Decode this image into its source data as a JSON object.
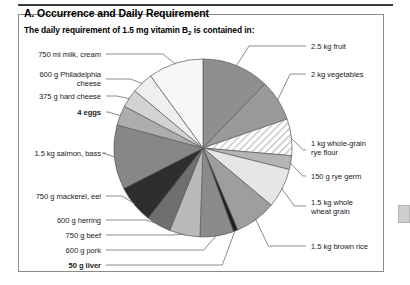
{
  "figure": {
    "section_title": "A. Occurrence and Daily Requirement",
    "subtitle_prefix": "The daily requirement of 1.5 mg vitamin B",
    "subtitle_subscript": "2",
    "subtitle_suffix": " is contained in:"
  },
  "colors": {
    "rule": "#3a3a3a",
    "panel_border": "#8b8b8b",
    "slice_stroke": "#5a5a5a",
    "page_tab": "#cfcfcf",
    "text": "#1a1a1a"
  },
  "chart_data": {
    "type": "pie",
    "title": "The daily requirement of 1.5 mg vitamin B2 is contained in:",
    "unit": "degrees of the circle (visual share)",
    "legend_position": "leader-labels around the pie",
    "grid": false,
    "labels": [
      "2.5 kg fruit",
      "2 kg vegetables",
      "1 kg whole-grain rye flour",
      "150 g rye germ",
      "1.5 kg whole wheat grain",
      "1.5 kg brown rice",
      "50 g liver",
      "600 g pork",
      "750 g beef",
      "600 g herring",
      "750 g mackerel, eel",
      "1.5 kg salmon, bass",
      "4 eggs",
      "375 g hard cheese",
      "600 g Philadelphia cheese",
      "750 ml milk, cream"
    ],
    "values": [
      44,
      27,
      24,
      9,
      26,
      27,
      3,
      22,
      20,
      16,
      25,
      42,
      13,
      12,
      14,
      36
    ],
    "fills": [
      "#8f8f8f",
      "#9a9a9a",
      "hatch",
      "#b5b5b5",
      "#e6e6e6",
      "#9e9e9e",
      "#1f1f1f",
      "#8a8a8a",
      "#b9b9b9",
      "#6f6f6f",
      "#2e2e2e",
      "#878787",
      "#adadad",
      "#d2d2d2",
      "#efefef",
      "#f7f7f7"
    ]
  },
  "labels_left": [
    {
      "name": "milk-cream",
      "text": "750 ml milk, cream",
      "bold": false
    },
    {
      "name": "philadelphia-cheese",
      "text": "600 g Philadelphia\ncheese",
      "bold": false
    },
    {
      "name": "hard-cheese",
      "text": "375 g hard cheese",
      "bold": false
    },
    {
      "name": "eggs",
      "text": "4 eggs",
      "bold": true
    },
    {
      "name": "salmon-bass",
      "text": "1.5 kg salmon, bass",
      "bold": false
    },
    {
      "name": "mackerel-eel",
      "text": "750 g mackerel, eel",
      "bold": false
    },
    {
      "name": "herring",
      "text": "600 g herring",
      "bold": false
    },
    {
      "name": "beef",
      "text": "750 g beef",
      "bold": false
    },
    {
      "name": "pork",
      "text": "600 g pork",
      "bold": false
    },
    {
      "name": "liver",
      "text": "50 g liver",
      "bold": true
    }
  ],
  "labels_right": [
    {
      "name": "fruit",
      "text": "2.5 kg fruit",
      "bold": false
    },
    {
      "name": "vegetables",
      "text": "2 kg vegetables",
      "bold": false
    },
    {
      "name": "rye-flour",
      "text": "1 kg whole-grain\nrye flour",
      "bold": false
    },
    {
      "name": "rye-germ",
      "text": "150 g rye germ",
      "bold": false
    },
    {
      "name": "whole-wheat-grain",
      "text": "1.5 kg whole\nwheat grain",
      "bold": false
    },
    {
      "name": "brown-rice",
      "text": "1.5 kg brown rice",
      "bold": false
    }
  ]
}
